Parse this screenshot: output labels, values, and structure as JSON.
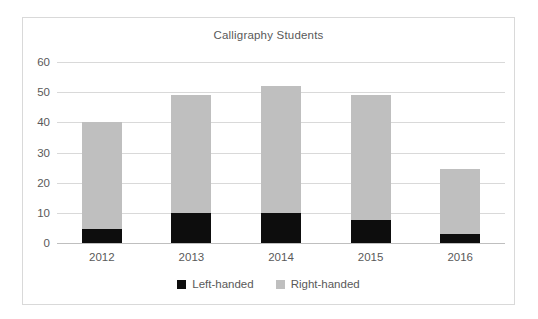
{
  "chart_data": {
    "type": "bar",
    "subtype": "stacked-column",
    "title": "Calligraphy Students",
    "xlabel": "",
    "ylabel": "",
    "categories": [
      "2012",
      "2013",
      "2014",
      "2015",
      "2016"
    ],
    "series": [
      {
        "name": "Left-handed",
        "color": "#0d0d0d",
        "values": [
          4.5,
          10,
          10,
          7.5,
          3
        ]
      },
      {
        "name": "Right-handed",
        "color": "#bfbfbf",
        "values": [
          35.5,
          39,
          42,
          41.5,
          21.5
        ]
      }
    ],
    "totals": [
      40,
      49,
      52,
      49,
      24.5
    ],
    "ylim": [
      0,
      60
    ],
    "y_ticks": [
      0,
      10,
      20,
      30,
      40,
      50,
      60
    ],
    "y_tick_labels": [
      "0",
      "10",
      "20",
      "30",
      "40",
      "50",
      "60"
    ],
    "grid": "horizontal",
    "legend_position": "bottom"
  },
  "legend": {
    "items": [
      {
        "label": "Left-handed",
        "color": "#0d0d0d",
        "swatch": "square-swatch-black"
      },
      {
        "label": "Right-handed",
        "color": "#bfbfbf",
        "swatch": "square-swatch-gray"
      }
    ]
  },
  "colors": {
    "border": "#d9d9d9",
    "gridline": "#d9d9d9",
    "baseline": "#bfbfbf",
    "text": "#595959",
    "background": "#ffffff"
  }
}
